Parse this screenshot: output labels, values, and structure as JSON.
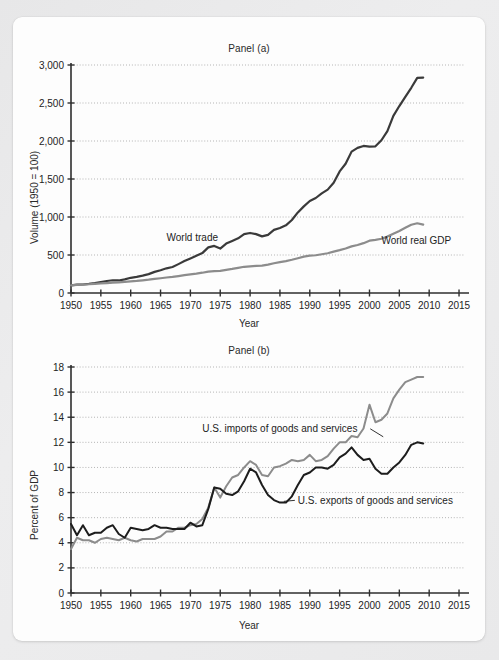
{
  "figure": {
    "background_color": "#ececed",
    "card_color": "#fdfdfd"
  },
  "chart_data": [
    {
      "type": "line",
      "title": "Panel (a)",
      "xlabel": "Year",
      "ylabel": "Volume (1950 = 100)",
      "xlim": [
        1950,
        2016
      ],
      "ylim": [
        0,
        3000
      ],
      "xticks": [
        1950,
        1955,
        1960,
        1965,
        1970,
        1975,
        1980,
        1985,
        1990,
        1995,
        2000,
        2005,
        2010,
        2015
      ],
      "yticks": [
        0,
        500,
        1000,
        1500,
        2000,
        2500,
        3000
      ],
      "ytick_labels": [
        "0",
        "500",
        "1,000",
        "1,500",
        "2,000",
        "2,500",
        "3,000"
      ],
      "grid": "horizontal-dotted",
      "legend": "inline-annotations",
      "series": [
        {
          "name": "World trade",
          "color": "#3a3a3a",
          "label_x": 1966,
          "label_y": 690,
          "x": [
            1950,
            1951,
            1952,
            1953,
            1954,
            1955,
            1956,
            1957,
            1958,
            1959,
            1960,
            1961,
            1962,
            1963,
            1964,
            1965,
            1966,
            1967,
            1968,
            1969,
            1970,
            1971,
            1972,
            1973,
            1974,
            1975,
            1976,
            1977,
            1978,
            1979,
            1980,
            1981,
            1982,
            1983,
            1984,
            1985,
            1986,
            1987,
            1988,
            1989,
            1990,
            1991,
            1992,
            1993,
            1994,
            1995,
            1996,
            1997,
            1998,
            1999,
            2000,
            2001,
            2002,
            2003,
            2004,
            2005,
            2006,
            2007,
            2008,
            2009
          ],
          "values": [
            100,
            110,
            112,
            120,
            130,
            145,
            158,
            168,
            165,
            180,
            200,
            212,
            228,
            248,
            278,
            300,
            325,
            342,
            380,
            420,
            455,
            490,
            525,
            600,
            620,
            585,
            650,
            685,
            720,
            775,
            790,
            775,
            745,
            765,
            830,
            855,
            890,
            960,
            1060,
            1140,
            1210,
            1250,
            1310,
            1360,
            1450,
            1600,
            1700,
            1860,
            1910,
            1935,
            1925,
            1930,
            2010,
            2130,
            2330,
            2460,
            2580,
            2700,
            2830,
            2835
          ]
        },
        {
          "name": "World real GDP",
          "color": "#8c8c8c",
          "label_x": 2002,
          "label_y": 640,
          "x": [
            1950,
            1951,
            1952,
            1953,
            1954,
            1955,
            1956,
            1957,
            1958,
            1959,
            1960,
            1961,
            1962,
            1963,
            1964,
            1965,
            1966,
            1967,
            1968,
            1969,
            1970,
            1971,
            1972,
            1973,
            1974,
            1975,
            1976,
            1977,
            1978,
            1979,
            1980,
            1981,
            1982,
            1983,
            1984,
            1985,
            1986,
            1987,
            1988,
            1989,
            1990,
            1991,
            1992,
            1993,
            1994,
            1995,
            1996,
            1997,
            1998,
            1999,
            2000,
            2001,
            2002,
            2003,
            2004,
            2005,
            2006,
            2007,
            2008,
            2009
          ],
          "values": [
            100,
            106,
            110,
            115,
            119,
            126,
            131,
            136,
            139,
            146,
            153,
            159,
            167,
            175,
            185,
            194,
            204,
            211,
            223,
            235,
            245,
            254,
            267,
            282,
            288,
            292,
            305,
            317,
            331,
            345,
            351,
            357,
            360,
            373,
            392,
            406,
            420,
            437,
            458,
            478,
            492,
            497,
            510,
            523,
            544,
            564,
            586,
            614,
            631,
            656,
            689,
            700,
            714,
            742,
            780,
            816,
            858,
            898,
            918,
            900
          ]
        }
      ]
    },
    {
      "type": "line",
      "title": "Panel (b)",
      "xlabel": "Year",
      "ylabel": "Percent of GDP",
      "xlim": [
        1950,
        2016
      ],
      "ylim": [
        0,
        18
      ],
      "xticks": [
        1950,
        1955,
        1960,
        1965,
        1970,
        1975,
        1980,
        1985,
        1990,
        1995,
        2000,
        2005,
        2010,
        2015
      ],
      "yticks": [
        0,
        2,
        4,
        6,
        8,
        10,
        12,
        14,
        16,
        18
      ],
      "ytick_labels": [
        "0",
        "2",
        "4",
        "6",
        "8",
        "10",
        "12",
        "14",
        "16",
        "18"
      ],
      "grid": "horizontal-dotted",
      "legend": "inline-annotations",
      "series": [
        {
          "name": "U.S. imports of goods and services",
          "color": "#8c8c8c",
          "label_x": 1972,
          "label_y": 12.8,
          "leader_to_x": 1996,
          "leader_to_y": 11.8,
          "x": [
            1950,
            1951,
            1952,
            1953,
            1954,
            1955,
            1956,
            1957,
            1958,
            1959,
            1960,
            1961,
            1962,
            1963,
            1964,
            1965,
            1966,
            1967,
            1968,
            1969,
            1970,
            1971,
            1972,
            1973,
            1974,
            1975,
            1976,
            1977,
            1978,
            1979,
            1980,
            1981,
            1982,
            1983,
            1984,
            1985,
            1986,
            1987,
            1988,
            1989,
            1990,
            1991,
            1992,
            1993,
            1994,
            1995,
            1996,
            1997,
            1998,
            1999,
            2000,
            2001,
            2002,
            2003,
            2004,
            2005,
            2006,
            2007,
            2008,
            2009
          ],
          "values": [
            3.5,
            4.4,
            4.2,
            4.2,
            4.0,
            4.3,
            4.4,
            4.3,
            4.2,
            4.4,
            4.2,
            4.1,
            4.3,
            4.3,
            4.3,
            4.5,
            4.9,
            4.9,
            5.2,
            5.2,
            5.4,
            5.5,
            5.9,
            6.8,
            8.4,
            7.6,
            8.5,
            9.2,
            9.4,
            10.0,
            10.5,
            10.2,
            9.4,
            9.3,
            10.0,
            10.1,
            10.3,
            10.6,
            10.5,
            10.6,
            11.0,
            10.5,
            10.6,
            10.9,
            11.5,
            12.0,
            12.0,
            12.5,
            12.4,
            13.1,
            15.0,
            13.6,
            13.8,
            14.3,
            15.5,
            16.2,
            16.8,
            17.0,
            17.2,
            17.2
          ]
        },
        {
          "name": "U.S. exports of goods and services",
          "color": "#1d1d1d",
          "label_x": 1988,
          "label_y": 7.1,
          "leader_to_x": 1986,
          "leader_to_y": 7.3,
          "x": [
            1950,
            1951,
            1952,
            1953,
            1954,
            1955,
            1956,
            1957,
            1958,
            1959,
            1960,
            1961,
            1962,
            1963,
            1964,
            1965,
            1966,
            1967,
            1968,
            1969,
            1970,
            1971,
            1972,
            1973,
            1974,
            1975,
            1976,
            1977,
            1978,
            1979,
            1980,
            1981,
            1982,
            1983,
            1984,
            1985,
            1986,
            1987,
            1988,
            1989,
            1990,
            1991,
            1992,
            1993,
            1994,
            1995,
            1996,
            1997,
            1998,
            1999,
            2000,
            2001,
            2002,
            2003,
            2004,
            2005,
            2006,
            2007,
            2008,
            2009
          ],
          "values": [
            5.5,
            4.6,
            5.4,
            4.6,
            4.8,
            4.8,
            5.2,
            5.4,
            4.7,
            4.4,
            5.2,
            5.1,
            5.0,
            5.1,
            5.4,
            5.2,
            5.2,
            5.1,
            5.1,
            5.1,
            5.6,
            5.3,
            5.4,
            6.7,
            8.4,
            8.3,
            7.9,
            7.8,
            8.1,
            8.9,
            9.9,
            9.6,
            8.6,
            7.8,
            7.4,
            7.2,
            7.2,
            7.7,
            8.6,
            9.4,
            9.6,
            10.0,
            10.0,
            9.9,
            10.2,
            10.8,
            11.1,
            11.6,
            11.0,
            10.6,
            10.7,
            9.9,
            9.5,
            9.5,
            10.0,
            10.4,
            11.0,
            11.8,
            12.0,
            11.9
          ]
        }
      ]
    }
  ]
}
